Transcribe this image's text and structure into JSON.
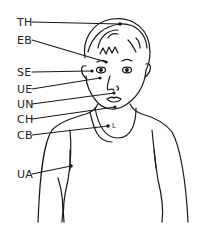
{
  "diagram": {
    "line_color": "#1a1a1a",
    "points": [
      {
        "label": "TH",
        "lx": 17,
        "ly": 17,
        "px": 120,
        "py": 24
      },
      {
        "label": "EB",
        "lx": 17,
        "ly": 35,
        "px": 106,
        "py": 62
      },
      {
        "label": "SE",
        "lx": 17,
        "ly": 67,
        "px": 92,
        "py": 71
      },
      {
        "label": "UE",
        "lx": 17,
        "ly": 84,
        "px": 100,
        "py": 78
      },
      {
        "label": "UN",
        "lx": 17,
        "ly": 99,
        "px": 114,
        "py": 93
      },
      {
        "label": "CH",
        "lx": 17,
        "ly": 114,
        "px": 115,
        "py": 107
      },
      {
        "label": "CB",
        "lx": 17,
        "ly": 130,
        "px": 108,
        "py": 126
      },
      {
        "label": "UA",
        "lx": 17,
        "ly": 169,
        "px": 71,
        "py": 166
      }
    ],
    "side_mark": "L"
  }
}
